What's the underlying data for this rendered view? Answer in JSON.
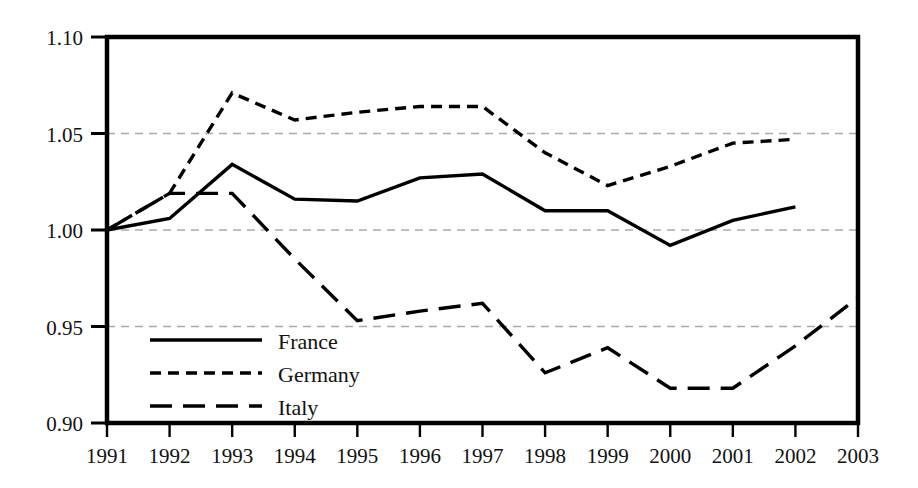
{
  "chart_data": {
    "type": "line",
    "title": "",
    "subtitle": "",
    "xlabel": "",
    "ylabel": "",
    "x": [
      1991,
      1992,
      1993,
      1994,
      1995,
      1996,
      1997,
      1998,
      1999,
      2000,
      2001,
      2002,
      2003
    ],
    "categories": [
      "1991",
      "1992",
      "1993",
      "1994",
      "1995",
      "1996",
      "1997",
      "1998",
      "1999",
      "2000",
      "2001",
      "2002",
      "2003"
    ],
    "xlim": [
      1991,
      2003
    ],
    "ylim": [
      0.9,
      1.1
    ],
    "yticks": [
      0.9,
      0.95,
      1.0,
      1.05,
      1.1
    ],
    "ytick_labels": [
      "0.90",
      "0.95",
      "1.00",
      "1.05",
      "1.10"
    ],
    "xticks": [
      1991,
      1992,
      1993,
      1994,
      1995,
      1996,
      1997,
      1998,
      1999,
      2000,
      2001,
      2002,
      2003
    ],
    "xtick_labels": [
      "1991",
      "1992",
      "1993",
      "1994",
      "1995",
      "1996",
      "1997",
      "1998",
      "1999",
      "2000",
      "2001",
      "2002",
      "2003"
    ],
    "grid": true,
    "grid_axis": "y",
    "grid_style": "dashed",
    "grid_color": "#aaaaaa",
    "frame": true,
    "frame_color": "#000000",
    "legend_position": "lower-left-inside",
    "series": [
      {
        "name": "France",
        "style": "solid",
        "color": "#000000",
        "x": [
          1991,
          1992,
          1993,
          1994,
          1995,
          1996,
          1997,
          1998,
          1999,
          2000,
          2001,
          2002
        ],
        "values": [
          1.0,
          1.006,
          1.034,
          1.016,
          1.015,
          1.027,
          1.029,
          1.01,
          1.01,
          0.992,
          1.005,
          1.012
        ]
      },
      {
        "name": "Germany",
        "style": "short-dash",
        "color": "#000000",
        "x": [
          1991,
          1992,
          1993,
          1994,
          1995,
          1996,
          1997,
          1998,
          1999,
          2000,
          2001,
          2002
        ],
        "values": [
          1.0,
          1.019,
          1.071,
          1.057,
          1.061,
          1.064,
          1.064,
          1.04,
          1.023,
          1.033,
          1.045,
          1.047
        ]
      },
      {
        "name": "Italy",
        "style": "long-dash",
        "color": "#000000",
        "x": [
          1991,
          1992,
          1993,
          1994,
          1995,
          1996,
          1997,
          1998,
          1999,
          2000,
          2001,
          2002,
          2003
        ],
        "values": [
          1.0,
          1.019,
          1.019,
          0.985,
          0.953,
          0.958,
          0.962,
          0.926,
          0.939,
          0.918,
          0.918,
          0.94,
          0.965
        ]
      }
    ],
    "legend": [
      {
        "label": "France",
        "style": "solid"
      },
      {
        "label": "Germany",
        "style": "short-dash"
      },
      {
        "label": "Italy",
        "style": "long-dash"
      }
    ]
  }
}
